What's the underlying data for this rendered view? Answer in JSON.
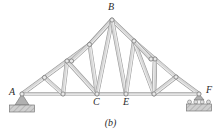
{
  "figure": {
    "caption": "(b)",
    "type": "pin-jointed roof truss diagram",
    "canvas": {
      "width": 221,
      "height": 135,
      "background": "#ffffff"
    }
  },
  "style": {
    "member_fill": "#d6d6d6",
    "member_stroke": "#9a9a9a",
    "member_highlight": "#f0f0f0",
    "joint_fill": "#e8e8e8",
    "joint_stroke": "#7d7d7d",
    "support_fill": "#b0b0b0",
    "support_stroke": "#7a7a7a",
    "hatch_fill": "#c9c9c9",
    "label_color": "#2b2b2b"
  },
  "labels": [
    {
      "name": "joint-label-A",
      "text": "A",
      "x": 9,
      "y": 87
    },
    {
      "name": "joint-label-B",
      "text": "B",
      "x": 108,
      "y": 2
    },
    {
      "name": "joint-label-C",
      "text": "C",
      "x": 93,
      "y": 97
    },
    {
      "name": "joint-label-E",
      "text": "E",
      "x": 123,
      "y": 97
    },
    {
      "name": "joint-label-F",
      "text": "F",
      "x": 206,
      "y": 85
    }
  ],
  "joints": [
    {
      "id": "A",
      "label": "A",
      "x": 22,
      "y": 94,
      "r": 2.1
    },
    {
      "id": "n1",
      "label": "",
      "x": 44.5,
      "y": 77.5,
      "r": 2.1
    },
    {
      "id": "n2",
      "label": "",
      "x": 67,
      "y": 61,
      "r": 2.1
    },
    {
      "id": "n3",
      "label": "",
      "x": 89.5,
      "y": 44.5,
      "r": 2.1
    },
    {
      "id": "B",
      "label": "B",
      "x": 112,
      "y": 20,
      "r": 2.1
    },
    {
      "id": "n4",
      "label": "",
      "x": 134,
      "y": 41,
      "r": 2.1
    },
    {
      "id": "n5",
      "label": "",
      "x": 155,
      "y": 59,
      "r": 2.1
    },
    {
      "id": "n6",
      "label": "",
      "x": 176,
      "y": 77,
      "r": 2.1
    },
    {
      "id": "F",
      "label": "F",
      "x": 199,
      "y": 94,
      "r": 2.1
    },
    {
      "id": "n7",
      "label": "",
      "x": 63,
      "y": 94,
      "r": 2.1
    },
    {
      "id": "C",
      "label": "C",
      "x": 97,
      "y": 94,
      "r": 2.1
    },
    {
      "id": "E",
      "label": "E",
      "x": 126,
      "y": 94,
      "r": 2.1
    },
    {
      "id": "n8",
      "label": "",
      "x": 154,
      "y": 94,
      "r": 2.1
    },
    {
      "id": "n9",
      "label": "",
      "x": 71.5,
      "y": 61,
      "r": 2.1
    },
    {
      "id": "n10",
      "label": "",
      "x": 151,
      "y": 59,
      "r": 2.1
    }
  ],
  "members": [
    {
      "from": "A",
      "to": "n1",
      "kind": "top-chord"
    },
    {
      "from": "n1",
      "to": "n2",
      "kind": "top-chord"
    },
    {
      "from": "n2",
      "to": "n3",
      "kind": "top-chord"
    },
    {
      "from": "n3",
      "to": "B",
      "kind": "top-chord"
    },
    {
      "from": "B",
      "to": "n4",
      "kind": "top-chord"
    },
    {
      "from": "n4",
      "to": "n5",
      "kind": "top-chord"
    },
    {
      "from": "n5",
      "to": "n6",
      "kind": "top-chord"
    },
    {
      "from": "n6",
      "to": "F",
      "kind": "top-chord"
    },
    {
      "from": "A",
      "to": "n7",
      "kind": "bottom-chord"
    },
    {
      "from": "n7",
      "to": "C",
      "kind": "bottom-chord"
    },
    {
      "from": "C",
      "to": "E",
      "kind": "bottom-chord"
    },
    {
      "from": "E",
      "to": "n8",
      "kind": "bottom-chord"
    },
    {
      "from": "n8",
      "to": "F",
      "kind": "bottom-chord"
    },
    {
      "from": "n1",
      "to": "n7",
      "kind": "web"
    },
    {
      "from": "n7",
      "to": "n2",
      "kind": "web"
    },
    {
      "from": "n2",
      "to": "C",
      "kind": "web"
    },
    {
      "from": "C",
      "to": "n3",
      "kind": "web"
    },
    {
      "from": "n3",
      "to": "B",
      "kind": "web"
    },
    {
      "from": "C",
      "to": "B",
      "kind": "web"
    },
    {
      "from": "E",
      "to": "B",
      "kind": "web"
    },
    {
      "from": "E",
      "to": "n4",
      "kind": "web"
    },
    {
      "from": "n4",
      "to": "n8",
      "kind": "web"
    },
    {
      "from": "n8",
      "to": "n5",
      "kind": "web"
    },
    {
      "from": "n5",
      "to": "n8",
      "kind": "web"
    },
    {
      "from": "n8",
      "to": "n6",
      "kind": "web"
    },
    {
      "from": "n2",
      "to": "n9",
      "kind": "strut"
    },
    {
      "from": "n9",
      "to": "n3",
      "kind": "strut"
    },
    {
      "from": "n5",
      "to": "n10",
      "kind": "strut"
    },
    {
      "from": "n10",
      "to": "n4",
      "kind": "strut"
    }
  ],
  "supports": [
    {
      "name": "pin-support-A",
      "type": "pin",
      "joint": "A",
      "x": 22,
      "y": 94,
      "triangle_half_width": 7,
      "triangle_height": 11,
      "base_width": 25,
      "base_height": 7
    },
    {
      "name": "roller-support-F",
      "type": "roller",
      "joint": "F",
      "x": 199,
      "y": 94,
      "roller_count": 4,
      "roller_radius": 2,
      "base_width": 25,
      "base_height": 7
    }
  ]
}
